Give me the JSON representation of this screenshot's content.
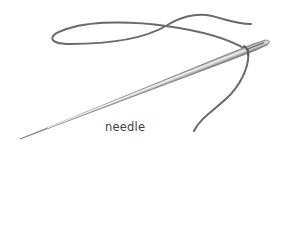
{
  "illustration": {
    "subject": "needle-and-thread",
    "label": "needle",
    "colors": {
      "background": "#ffffff",
      "thread": "#6a6a6a",
      "needle_dark": "#7a7a7a",
      "needle_light": "#e6e6e6",
      "label": "#3f3f3f"
    }
  }
}
